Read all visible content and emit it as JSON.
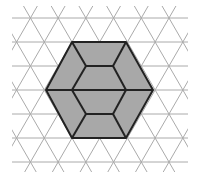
{
  "diagram": {
    "grid": {
      "type": "triangular",
      "row_spacing_px": 24,
      "first_row_y": 18,
      "rows": 7,
      "x_min": 12,
      "x_max": 188,
      "y_min": 6,
      "y_max": 172,
      "color": "#aaaaaa"
    },
    "hexagon": {
      "vertices": [
        [
          72,
          42
        ],
        [
          126,
          42
        ],
        [
          153,
          90
        ],
        [
          126,
          138
        ],
        [
          72,
          138
        ],
        [
          46,
          90
        ]
      ],
      "fill": "#a8a8a8",
      "stroke": "#222222"
    },
    "inner_segments": [
      [
        [
          72,
          42
        ],
        [
          86,
          66
        ]
      ],
      [
        [
          86,
          66
        ],
        [
          113,
          66
        ]
      ],
      [
        [
          113,
          66
        ],
        [
          126,
          42
        ]
      ],
      [
        [
          86,
          66
        ],
        [
          72,
          90
        ]
      ],
      [
        [
          113,
          66
        ],
        [
          126,
          90
        ]
      ],
      [
        [
          46,
          90
        ],
        [
          153,
          90
        ]
      ],
      [
        [
          72,
          90
        ],
        [
          86,
          114
        ]
      ],
      [
        [
          126,
          90
        ],
        [
          113,
          114
        ]
      ],
      [
        [
          86,
          114
        ],
        [
          113,
          114
        ]
      ],
      [
        [
          86,
          114
        ],
        [
          72,
          138
        ]
      ],
      [
        [
          113,
          114
        ],
        [
          126,
          138
        ]
      ]
    ]
  }
}
